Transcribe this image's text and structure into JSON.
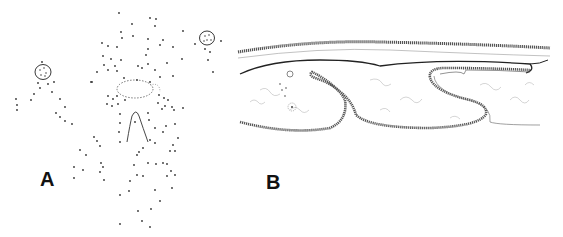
{
  "figure": {
    "panels": [
      {
        "id": "A",
        "label": "A",
        "description": "Stippled drawing: scattered dots with two small circular cells and central oval and tapering structure"
      },
      {
        "id": "B",
        "label": "B",
        "description": "Histological section drawing: layered epithelium with folded invaginations and fibrous stroma"
      }
    ]
  }
}
